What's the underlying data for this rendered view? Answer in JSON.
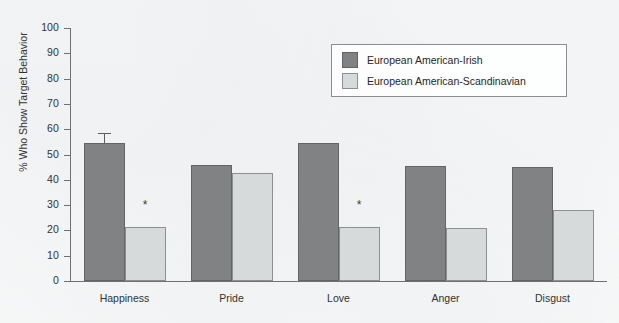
{
  "chart_data": {
    "type": "bar",
    "title": "",
    "subtitle": "",
    "xlabel": "",
    "ylabel": "% Who Show Target Behavior",
    "ylim": [
      0,
      100
    ],
    "yticks": [
      0,
      10,
      20,
      30,
      40,
      50,
      60,
      70,
      80,
      90,
      100
    ],
    "ytick_labels": [
      "0",
      "10",
      "20",
      "30",
      "40",
      "50",
      "60",
      "70",
      "80",
      "90",
      "100"
    ],
    "grid": false,
    "legend_position": "top-right",
    "categories": [
      "Happiness",
      "Pride",
      "Love",
      "Anger",
      "Disgust"
    ],
    "series": [
      {
        "name": "European American-Irish",
        "color": "#818284",
        "values": [
          54.5,
          46.0,
          54.5,
          45.5,
          45.0
        ],
        "errors": [
          3.5,
          null,
          null,
          null,
          null
        ]
      },
      {
        "name": "European American-Scandinavian",
        "color": "#d7dadb",
        "values": [
          21.5,
          42.5,
          21.5,
          21.0,
          28.0
        ],
        "errors": [
          null,
          null,
          null,
          null,
          null
        ]
      }
    ],
    "annotations": [
      {
        "text": "*",
        "category": "Happiness",
        "series": "European American-Scandinavian",
        "value": 30
      },
      {
        "text": "*",
        "category": "Love",
        "series": "European American-Scandinavian",
        "value": 30
      }
    ]
  },
  "legend": {
    "entries": [
      {
        "label": "European American-Irish",
        "swatch": "dark"
      },
      {
        "label": "European American-Scandinavian",
        "swatch": "light"
      }
    ]
  },
  "colors": {
    "series_dark": "#818284",
    "series_light": "#d7dadb",
    "axis": "#6f7072",
    "text": "#323232",
    "background": "#ffffff"
  }
}
